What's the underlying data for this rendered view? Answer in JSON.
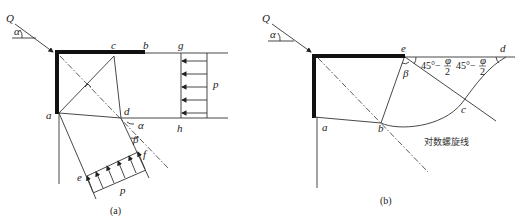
{
  "figure_a": {
    "caption": "(a)",
    "labels": {
      "Q": "Q",
      "alpha_top": "α",
      "a": "a",
      "b": "b",
      "c": "c",
      "d": "d",
      "e": "e",
      "f": "f",
      "g": "g",
      "h": "h",
      "p_right": "p",
      "p_bottom": "p",
      "alpha_d": "α",
      "beta_d": "β"
    }
  },
  "figure_b": {
    "caption": "(b)",
    "labels": {
      "Q": "Q",
      "alpha_top": "α",
      "a": "a",
      "b": "b",
      "c": "c",
      "d": "d",
      "e": "e",
      "beta": "β",
      "angle1": "45°−",
      "angle1_frac_num": "φ",
      "angle1_frac_den": "2",
      "angle2": "45°−",
      "angle2_frac_num": "φ",
      "angle2_frac_den": "2",
      "spiral_label": "对数螺旋线"
    }
  }
}
